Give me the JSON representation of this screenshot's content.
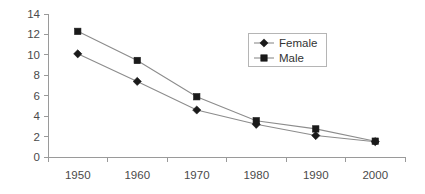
{
  "chart_data": {
    "type": "line",
    "title": "",
    "xlabel": "",
    "ylabel": "",
    "categories": [
      "1950",
      "1960",
      "1970",
      "1980",
      "1990",
      "2000"
    ],
    "x": [
      1950,
      1960,
      1970,
      1980,
      1990,
      2000
    ],
    "series": [
      {
        "name": "Female",
        "marker": "diamond",
        "values": [
          10.1,
          7.4,
          4.6,
          3.2,
          2.1,
          1.5
        ]
      },
      {
        "name": "Male",
        "marker": "square",
        "values": [
          12.3,
          9.45,
          5.9,
          3.55,
          2.75,
          1.55
        ]
      }
    ],
    "ylim": [
      0,
      14
    ],
    "y_ticks": [
      "0",
      "2",
      "4",
      "6",
      "8",
      "10",
      "12",
      "14"
    ],
    "y_tick_values": [
      0,
      2,
      4,
      6,
      8,
      10,
      12,
      14
    ],
    "x_tick_labels": [
      "1950",
      "1960",
      "1970",
      "1980",
      "1990",
      "2000"
    ],
    "grid": false,
    "legend_position": "upper-right",
    "legend_entries": [
      "Female",
      "Male"
    ],
    "colors": {
      "marker": "#1a1a1a",
      "line": "#8c8c8c",
      "axis": "#9a9a9a",
      "text": "#4a4a4a",
      "legend_border": "#b5b5b5",
      "background": "#ffffff"
    }
  }
}
